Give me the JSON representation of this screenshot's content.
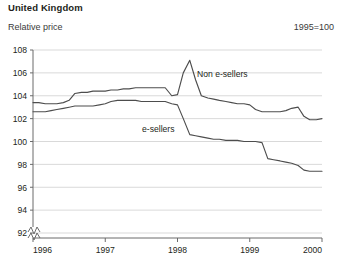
{
  "header": {
    "title": "United Kingdom",
    "subtitle": "Relative price",
    "index_note": "1995=100"
  },
  "chart_data": {
    "type": "line",
    "title": "United Kingdom",
    "subtitle": "Relative price",
    "annotation_index_base": "1995=100",
    "xlabel": "",
    "ylabel": "Relative price",
    "xlim": [
      1996,
      2000
    ],
    "ylim": [
      92,
      108
    ],
    "y_axis_break_at": 92,
    "grid": true,
    "grid_axis": "y",
    "legend": "inline-labels",
    "xticks": [
      "1996",
      "1997",
      "1998",
      "1999",
      "2000"
    ],
    "xtick_values": [
      1996,
      1997,
      1998,
      1999,
      2000
    ],
    "yticks": [
      "92",
      "94",
      "96",
      "98",
      "100",
      "102",
      "104",
      "106",
      "108"
    ],
    "ytick_values": [
      92,
      94,
      96,
      98,
      100,
      102,
      104,
      106,
      108
    ],
    "line_color": "#4d4d4d",
    "grid_color": "#c9c9c9",
    "axis_color": "#6b6b6b",
    "annotations": [
      {
        "text": "Non e-sellers",
        "x": 1998.35,
        "y": 104.6
      },
      {
        "text": "e-sellers",
        "x": 1997.55,
        "y": 100.7
      }
    ],
    "series": [
      {
        "name": "Non e-sellers",
        "x": [
          1996.0,
          1996.08,
          1996.17,
          1996.25,
          1996.33,
          1996.42,
          1996.5,
          1996.58,
          1996.67,
          1996.75,
          1996.83,
          1996.92,
          1997.0,
          1997.08,
          1997.17,
          1997.25,
          1997.33,
          1997.42,
          1997.5,
          1997.58,
          1997.67,
          1997.75,
          1997.83,
          1997.92,
          1998.0,
          1998.08,
          1998.17,
          1998.25,
          1998.33,
          1998.42,
          1998.5,
          1998.58,
          1998.67,
          1998.75,
          1998.83,
          1998.92,
          1999.0,
          1999.08,
          1999.17,
          1999.25,
          1999.33,
          1999.42,
          1999.5,
          1999.58,
          1999.67,
          1999.75,
          1999.83,
          1999.92,
          2000.0
        ],
        "values": [
          103.4,
          103.4,
          103.3,
          103.3,
          103.3,
          103.4,
          103.6,
          104.2,
          104.3,
          104.3,
          104.4,
          104.4,
          104.4,
          104.5,
          104.5,
          104.6,
          104.6,
          104.7,
          104.7,
          104.7,
          104.7,
          104.7,
          104.7,
          104.0,
          104.1,
          106.0,
          107.1,
          105.4,
          104.0,
          103.8,
          103.7,
          103.6,
          103.5,
          103.4,
          103.3,
          103.3,
          103.2,
          102.8,
          102.6,
          102.6,
          102.6,
          102.6,
          102.7,
          102.9,
          103.0,
          102.2,
          101.9,
          101.9,
          102.0
        ]
      },
      {
        "name": "e-sellers",
        "x": [
          1996.0,
          1996.08,
          1996.17,
          1996.25,
          1996.33,
          1996.42,
          1996.5,
          1996.58,
          1996.67,
          1996.75,
          1996.83,
          1996.92,
          1997.0,
          1997.08,
          1997.17,
          1997.25,
          1997.33,
          1997.42,
          1997.5,
          1997.58,
          1997.67,
          1997.75,
          1997.83,
          1997.92,
          1998.0,
          1998.08,
          1998.17,
          1998.25,
          1998.33,
          1998.42,
          1998.5,
          1998.58,
          1998.67,
          1998.75,
          1998.83,
          1998.92,
          1999.0,
          1999.08,
          1999.17,
          1999.25,
          1999.33,
          1999.42,
          1999.5,
          1999.58,
          1999.67,
          1999.75,
          1999.83,
          1999.92,
          2000.0
        ],
        "values": [
          102.6,
          102.6,
          102.6,
          102.7,
          102.8,
          102.9,
          103.0,
          103.1,
          103.1,
          103.1,
          103.1,
          103.2,
          103.3,
          103.5,
          103.6,
          103.6,
          103.6,
          103.6,
          103.5,
          103.5,
          103.5,
          103.5,
          103.5,
          103.3,
          103.2,
          102.0,
          100.6,
          100.5,
          100.4,
          100.3,
          100.2,
          100.2,
          100.1,
          100.1,
          100.1,
          100.0,
          100.0,
          100.0,
          99.9,
          98.5,
          98.4,
          98.3,
          98.2,
          98.1,
          97.9,
          97.5,
          97.4,
          97.4,
          97.4
        ]
      }
    ]
  },
  "icons": {
    "axis_break": "axis-break-zigzag"
  }
}
